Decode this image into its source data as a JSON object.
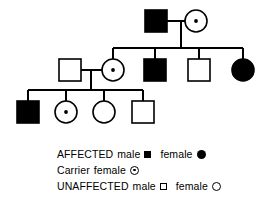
{
  "figure": {
    "kind": "pedigree-chart",
    "background_color": "#ffffff",
    "ink_color": "#000000"
  },
  "pedigree": {
    "generations": [
      {
        "id": "I",
        "individuals": [
          {
            "id": "I-1",
            "sex": "male",
            "status": "affected",
            "symbol": "filled-square",
            "cx": 156,
            "cy": 21
          },
          {
            "id": "I-2",
            "sex": "female",
            "status": "carrier",
            "symbol": "carrier-circle",
            "cx": 196,
            "cy": 21
          }
        ]
      },
      {
        "id": "II",
        "individuals": [
          {
            "id": "II-1",
            "sex": "male",
            "status": "unaffected",
            "symbol": "open-square",
            "cx": 70,
            "cy": 70
          },
          {
            "id": "II-2",
            "sex": "female",
            "status": "carrier",
            "symbol": "carrier-circle",
            "cx": 113,
            "cy": 70
          },
          {
            "id": "II-3",
            "sex": "male",
            "status": "affected",
            "symbol": "filled-square",
            "cx": 155,
            "cy": 70
          },
          {
            "id": "II-4",
            "sex": "male",
            "status": "unaffected",
            "symbol": "open-square",
            "cx": 199,
            "cy": 70
          },
          {
            "id": "II-5",
            "sex": "female",
            "status": "affected",
            "symbol": "filled-circle",
            "cx": 243,
            "cy": 70
          }
        ]
      },
      {
        "id": "III",
        "individuals": [
          {
            "id": "III-1",
            "sex": "male",
            "status": "affected",
            "symbol": "filled-square",
            "cx": 28,
            "cy": 112
          },
          {
            "id": "III-2",
            "sex": "female",
            "status": "carrier",
            "symbol": "carrier-circle",
            "cx": 66,
            "cy": 112
          },
          {
            "id": "III-3",
            "sex": "female",
            "status": "unaffected",
            "symbol": "open-circle",
            "cx": 104,
            "cy": 112
          },
          {
            "id": "III-4",
            "sex": "male",
            "status": "unaffected",
            "symbol": "open-square",
            "cx": 143,
            "cy": 112
          }
        ]
      }
    ],
    "matings": [
      {
        "id": "mating-1",
        "partners": [
          "I-1",
          "I-2"
        ],
        "children": [
          "II-2",
          "II-3",
          "II-4",
          "II-5"
        ]
      },
      {
        "id": "mating-2",
        "partners": [
          "II-1",
          "II-2"
        ],
        "children": [
          "III-1",
          "III-2",
          "III-3",
          "III-4"
        ]
      }
    ]
  },
  "legend": {
    "rows": [
      {
        "id": "legend-affected",
        "label": "AFFECTED",
        "entries": [
          {
            "text": "male",
            "key": "filled-square"
          },
          {
            "text": "female",
            "key": "filled-circle"
          }
        ]
      },
      {
        "id": "legend-carrier",
        "label": "Carrier",
        "entries": [
          {
            "text": "female",
            "key": "carrier-circle"
          }
        ]
      },
      {
        "id": "legend-unaffected",
        "label": "UNAFFECTED",
        "entries": [
          {
            "text": "male",
            "key": "open-square"
          },
          {
            "text": "female",
            "key": "open-circle"
          }
        ]
      }
    ]
  }
}
